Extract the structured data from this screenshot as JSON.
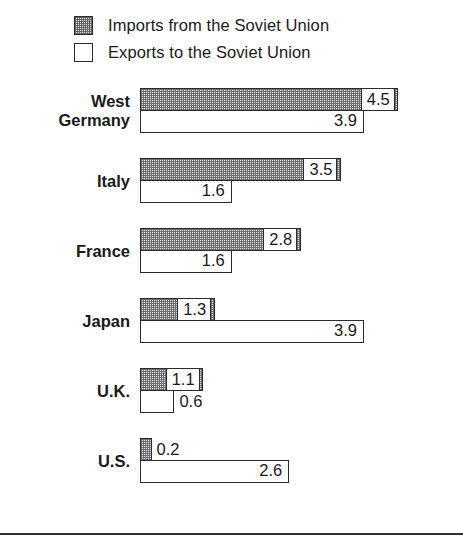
{
  "legend": {
    "items": [
      {
        "label": "Imports from the Soviet Union",
        "swatch": "shaded-square-icon"
      },
      {
        "label": "Exports to the Soviet Union",
        "swatch": "empty-square-icon"
      }
    ]
  },
  "chart_data": {
    "type": "bar",
    "orientation": "horizontal",
    "title": "",
    "xlabel": "",
    "ylabel": "",
    "grid": false,
    "legend_position": "top-left",
    "xlim": [
      0,
      4.5
    ],
    "categories": [
      "West Germany",
      "Italy",
      "France",
      "Japan",
      "U.K.",
      "U.S."
    ],
    "category_lines": [
      [
        "West",
        "Germany"
      ],
      [
        "Italy"
      ],
      [
        "France"
      ],
      [
        "Japan"
      ],
      [
        "U.K."
      ],
      [
        "U.S."
      ]
    ],
    "series": [
      {
        "name": "Imports from the Soviet Union",
        "values": [
          4.5,
          3.5,
          2.8,
          1.3,
          1.1,
          0.2
        ],
        "labels": [
          "4.5",
          "3.5",
          "2.8",
          "1.3",
          "1.1",
          "0.2"
        ]
      },
      {
        "name": "Exports to the Soviet Union",
        "values": [
          3.9,
          1.6,
          1.6,
          3.9,
          0.6,
          2.6
        ],
        "labels": [
          "3.9",
          "1.6",
          "1.6",
          "3.9",
          "0.6",
          "2.6"
        ]
      }
    ]
  },
  "render": {
    "px_per_unit": 57.4,
    "colors": {
      "ink": "#2b2b2b",
      "imports_fill": "#dcdcdc",
      "exports_fill": "#ffffff"
    }
  }
}
